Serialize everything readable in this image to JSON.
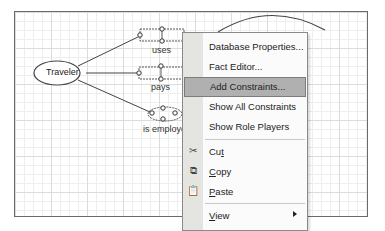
{
  "diagram": {
    "entities": [
      {
        "label": "Traveler"
      },
      {
        "label": "Former(ExM)"
      }
    ],
    "fact_types": [
      {
        "label": "uses"
      },
      {
        "label": "pays"
      },
      {
        "label": "is employed"
      }
    ],
    "colors": {
      "grid_major": "#dcdcdc",
      "grid_minor": "#eeeeee",
      "border": "#6a6a6a",
      "stroke": "#444444"
    }
  },
  "context_menu": {
    "items": [
      {
        "label": "Database Properties...",
        "icon": ""
      },
      {
        "label": "Fact Editor...",
        "icon": ""
      },
      {
        "label": "Add Constraints...",
        "icon": "",
        "active": true
      },
      {
        "label": "Show All Constraints",
        "icon": ""
      },
      {
        "label": "Show Role Players",
        "icon": ""
      },
      {
        "label_pre": "Cu",
        "label_ul": "t",
        "label_post": "",
        "icon": "scissors-icon"
      },
      {
        "label_pre": "",
        "label_ul": "C",
        "label_post": "opy",
        "icon": "copy-icon"
      },
      {
        "label_pre": "",
        "label_ul": "P",
        "label_post": "aste",
        "icon": "paste-icon"
      },
      {
        "label_pre": "",
        "label_ul": "V",
        "label_post": "iew",
        "icon": "",
        "submenu": true
      },
      {
        "label_pre": "F",
        "label_ul": "o",
        "label_post": "rmat",
        "icon": "",
        "submenu": true
      }
    ],
    "colors": {
      "gutter": "#e4e4e0",
      "highlight": "#b0b0b0",
      "background": "#fbfbfb"
    }
  }
}
